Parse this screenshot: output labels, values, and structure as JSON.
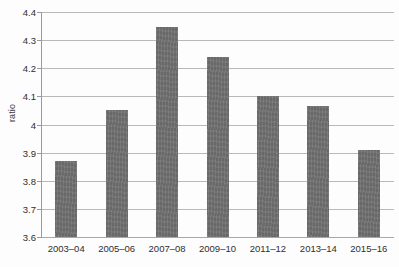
{
  "chart_data": {
    "type": "bar",
    "title": "",
    "xlabel": "",
    "ylabel": "ratio",
    "categories": [
      "2003–04",
      "2005–06",
      "2007–08",
      "2009–10",
      "2011–12",
      "2013–14",
      "2015–16"
    ],
    "values": [
      3.87,
      4.05,
      4.345,
      4.24,
      4.1,
      4.065,
      3.91
    ],
    "ylim": [
      3.6,
      4.4
    ],
    "ytick_values": [
      3.6,
      3.7,
      3.8,
      3.9,
      4.0,
      4.1,
      4.2,
      4.3,
      4.4
    ],
    "ytick_labels": [
      "3.6",
      "3.7",
      "3.8",
      "3.9",
      "4",
      "4.1",
      "4.2",
      "4.3",
      "4.4"
    ],
    "grid": true,
    "legend": false,
    "bar_color": "#727272",
    "gridline_color": "#b9b9b9",
    "axis_color": "#9a9a9a",
    "background_color": "#fdfdfd"
  }
}
